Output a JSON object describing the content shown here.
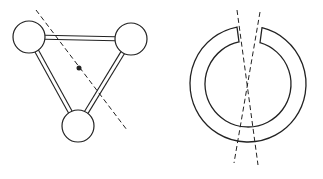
{
  "canvas": {
    "width": 323,
    "height": 179,
    "background": "#ffffff",
    "stroke": "#222222"
  },
  "figures": [
    {
      "id": "triangle-molecule",
      "description": "Three atoms (circles) joined by double-line bonds forming a triangle, with a dashed symmetry axis through a center dot",
      "atoms": [
        {
          "cx": 29,
          "cy": 37,
          "r": 16
        },
        {
          "cx": 131,
          "cy": 39,
          "r": 16
        },
        {
          "cx": 78,
          "cy": 126,
          "r": 16
        }
      ],
      "bonds": [
        {
          "from": 0,
          "to": 1
        },
        {
          "from": 0,
          "to": 2
        },
        {
          "from": 1,
          "to": 2
        }
      ],
      "center_dot": {
        "cx": 79,
        "cy": 68,
        "r": 2.5
      },
      "axis": {
        "x1": 36,
        "y1": 10,
        "x2": 127,
        "y2": 130
      }
    },
    {
      "id": "split-ring",
      "description": "Open ring with a gap at the top and two crossing dashed lines",
      "cx": 248,
      "cy": 84,
      "outer_r": 58,
      "inner_r": 43,
      "gap": {
        "left_x": 237,
        "right_x": 262
      },
      "axes": [
        {
          "x1": 237,
          "y1": 10,
          "x2": 258,
          "y2": 165
        },
        {
          "x1": 260,
          "y1": 12,
          "x2": 234,
          "y2": 163
        }
      ]
    }
  ]
}
